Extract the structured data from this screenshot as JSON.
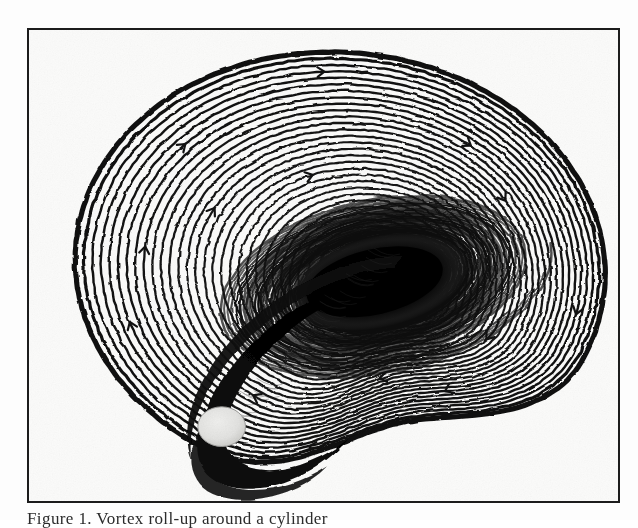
{
  "figure": {
    "kind": "scanned-scientific-figure",
    "medium": "halftone line engraving / photocopy",
    "caption_partial": "Figure 1.  Vortex roll-up around a cylinder",
    "frame": {
      "border_color": "#1c1c1c",
      "border_width_px": 2,
      "x": 27,
      "y": 28,
      "width": 593,
      "height": 475
    },
    "colors": {
      "background": "#fdfdfd",
      "paper": "#fbfbfa",
      "ink": "#111111",
      "frame": "#1c1c1c",
      "cylinder_fill": "#e2e2e0",
      "cylinder_edge": "#9a9a98",
      "dark_core": "#050505",
      "plume": "#0a0a0a"
    }
  },
  "chart_data": {
    "type": "line",
    "title": "",
    "subtitle": "",
    "xlabel": "",
    "ylabel": "",
    "grid": false,
    "legend": "none",
    "axes_visible": false,
    "tick_labels": [],
    "annotations": [],
    "outer_boundary": {
      "shape": "kidney",
      "center": [
        335,
        262
      ],
      "radius_x": 265,
      "radius_y": 218,
      "notch": {
        "center_angle_deg": 72,
        "depth": 58,
        "width_deg": 46
      }
    },
    "series": [
      {
        "name": "outer-streamlines",
        "role": "closed iso-contours",
        "count": 30,
        "stroke": "#111111",
        "levels": [
          1.0,
          0.965,
          0.931,
          0.897,
          0.862,
          0.828,
          0.793,
          0.759,
          0.724,
          0.69,
          0.655,
          0.621,
          0.586,
          0.552,
          0.517,
          0.483,
          0.448,
          0.414,
          0.379,
          0.345,
          0.31,
          0.276,
          0.241,
          0.207,
          0.172,
          0.138,
          0.103,
          0.069,
          0.034,
          0.0
        ]
      },
      {
        "name": "vortex-core-spiral",
        "role": "rolled-up spiral sheet",
        "center": [
          380,
          283
        ],
        "turns": 6.5,
        "r_start": 128,
        "r_end": 4,
        "count": 26,
        "stroke": "#111111"
      },
      {
        "name": "ejected-plume",
        "role": "dark braid of compressed streamlines",
        "from": [
          360,
          286
        ],
        "to": [
          196,
          440
        ],
        "stroke": "#0a0a0a",
        "max_width": 46
      }
    ],
    "markers": [
      {
        "name": "cylinder",
        "type": "ellipse",
        "center": [
          221,
          428
        ],
        "rx": 24,
        "ry": 20,
        "fill": "#e2e2e0",
        "stroke": "#9a9a98"
      }
    ],
    "direction_arrows": {
      "glyph": "chevron",
      "count": 14,
      "note": "small flow-direction chevrons straddling outer contour lines"
    }
  }
}
